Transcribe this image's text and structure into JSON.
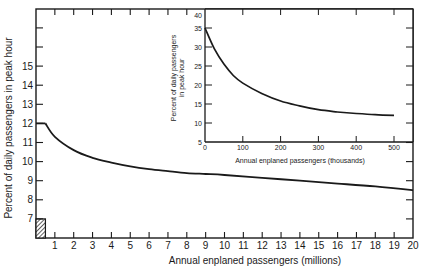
{
  "chart_data": [
    {
      "id": "main",
      "type": "line",
      "title": "",
      "xlabel": "Annual enplaned passengers (millions)",
      "ylabel": "Percent of daily passengers in peak hour",
      "xlim": [
        0,
        20
      ],
      "ylim": [
        6,
        18
      ],
      "x_ticks": [
        1,
        2,
        3,
        4,
        5,
        6,
        7,
        8,
        9,
        10,
        11,
        12,
        13,
        14,
        15,
        16,
        17,
        18,
        19,
        20
      ],
      "y_ticks": [
        7,
        8,
        9,
        10,
        11,
        12,
        13,
        14,
        15
      ],
      "grid": false,
      "series": [
        {
          "name": "Peak hour percentage",
          "x": [
            0,
            0.5,
            1,
            2,
            3,
            4,
            5,
            6,
            7,
            8,
            9,
            10,
            12,
            14,
            16,
            18,
            20
          ],
          "y": [
            12,
            12,
            11.3,
            10.6,
            10.2,
            9.95,
            9.75,
            9.6,
            9.5,
            9.4,
            9.35,
            9.3,
            9.15,
            9.0,
            8.85,
            8.7,
            8.5
          ]
        }
      ],
      "annotations": [
        {
          "type": "hatched-region",
          "x": [
            0,
            0.5
          ],
          "y": [
            6,
            7
          ]
        }
      ]
    },
    {
      "id": "inset",
      "type": "line",
      "title": "",
      "xlabel": "Annual enplaned passengers (thousands)",
      "ylabel": "Percent of daily passengers in peak hour",
      "xlim": [
        0,
        550
      ],
      "ylim": [
        5,
        40
      ],
      "x_ticks": [
        0,
        100,
        200,
        300,
        400,
        500
      ],
      "y_ticks": [
        5,
        10,
        15,
        20,
        25,
        30,
        35,
        40
      ],
      "grid": false,
      "series": [
        {
          "name": "Peak hour percentage (small airports)",
          "x": [
            0,
            25,
            50,
            75,
            100,
            150,
            200,
            250,
            300,
            350,
            400,
            450,
            500
          ],
          "y": [
            35,
            29.5,
            25.5,
            22.5,
            20.5,
            17.8,
            15.8,
            14.5,
            13.5,
            12.9,
            12.5,
            12.2,
            12.0
          ]
        }
      ]
    }
  ],
  "labels": {
    "main_xlabel": "Annual enplaned passengers (millions)",
    "main_ylabel": "Percent of daily passengers in peak hour",
    "inset_xlabel": "Annual enplaned passengers (thousands)",
    "inset_ylabel_line1": "Percent of daily passengers",
    "inset_ylabel_line2": "in peak hour"
  }
}
